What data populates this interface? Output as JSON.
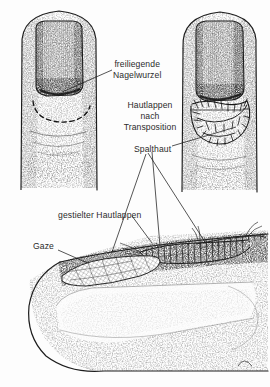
{
  "figure": {
    "background_color": "#fdfdfd",
    "ink_color": "#1c1c1c",
    "text_color": "#2b2b2b",
    "width": 270,
    "height": 387
  },
  "labels": {
    "exposed_nail_root": {
      "line1": "freiliegende",
      "line2": "Nagelwurzel"
    },
    "skin_flap_transposition": {
      "line1": "Hautlappen",
      "line2": "nach",
      "line3": "Transposition"
    },
    "split_thickness_graft": "Spalthaut",
    "pedicled_flap": "gestielter Hautlappen",
    "gauze": "Gaze"
  },
  "panels": {
    "top_left": {
      "name": "finger-preoperative",
      "description": "Fingerkuppe mit freiliegender Nagelwurzel und gestrichelter Schnittlinie"
    },
    "top_right": {
      "name": "finger-postoperative",
      "description": "Fingerkuppe nach Hautlappentransposition mit Nahtreihen"
    },
    "bottom": {
      "name": "finger-lateral-section",
      "description": "Seitenansicht mit gestieltem Hautlappen und Gazeverband"
    }
  }
}
